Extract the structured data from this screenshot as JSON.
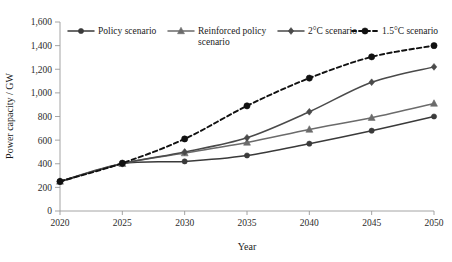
{
  "chart_data": {
    "type": "line",
    "title": "",
    "xlabel": "Year",
    "ylabel": "Power capacity / GW",
    "x": [
      2020,
      2025,
      2030,
      2035,
      2040,
      2045,
      2050
    ],
    "xlim": [
      2020,
      2050
    ],
    "ylim": [
      0,
      1600
    ],
    "xticks": [
      "2020",
      "2025",
      "2030",
      "2035",
      "2040",
      "2045",
      "2050"
    ],
    "yticks": [
      "0",
      "200",
      "400",
      "600",
      "800",
      "1,000",
      "1,200",
      "1,400",
      "1,600"
    ],
    "ytick_values": [
      0,
      200,
      400,
      600,
      800,
      1000,
      1200,
      1400,
      1600
    ],
    "grid": false,
    "legend_position": "top",
    "series": [
      {
        "name": "Policy scenario",
        "marker": "circle",
        "dash": "solid",
        "color": "#3a3a3a",
        "values": [
          250,
          400,
          420,
          470,
          570,
          680,
          800
        ]
      },
      {
        "name": "Reinforced policy scenario",
        "marker": "triangle",
        "dash": "solid",
        "color": "#6b6b6b",
        "values": [
          250,
          400,
          490,
          580,
          690,
          790,
          910
        ]
      },
      {
        "name": "2°C scenario",
        "marker": "diamond",
        "dash": "solid",
        "color": "#4a4a4a",
        "values": [
          250,
          400,
          500,
          620,
          840,
          1090,
          1220
        ]
      },
      {
        "name": "1.5°C scenario",
        "marker": "circle",
        "dash": "dashed",
        "color": "#111111",
        "values": [
          250,
          405,
          610,
          890,
          1125,
          1305,
          1400
        ]
      }
    ]
  },
  "legend": {
    "items": [
      {
        "label": "Policy scenario"
      },
      {
        "label": "Reinforced policy scenario"
      },
      {
        "label": "2°C scenario"
      },
      {
        "label": "1.5°C scenario"
      }
    ]
  }
}
